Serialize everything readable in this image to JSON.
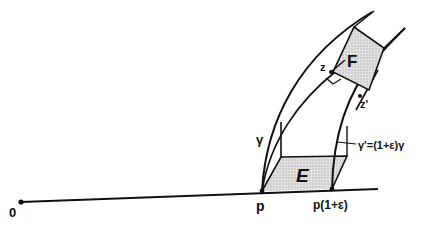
{
  "diagram": {
    "labels": {
      "origin": "0",
      "p": "p",
      "p_scaled": "p(1+ε)",
      "gamma": "γ",
      "gamma_prime": "γ'=(1+ε)γ",
      "z": "z",
      "z_prime": "z'",
      "box_E": "E",
      "box_F": "F"
    },
    "colors": {
      "stroke": "#111111",
      "shade": "#cfcfcf",
      "background": "#ffffff"
    }
  }
}
